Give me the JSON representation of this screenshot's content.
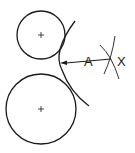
{
  "diagram": {
    "labels": {
      "radius": "A",
      "center_point": "X"
    },
    "circles": [
      {
        "name": "small-circle",
        "cx": 41,
        "cy": 35,
        "r": 24
      },
      {
        "name": "large-circle",
        "cx": 41,
        "cy": 109,
        "r": 35
      }
    ],
    "tangent_arc": {
      "cx": 111,
      "cy": 60,
      "r": 50
    },
    "colors": {
      "stroke": "#1a1a1a",
      "background": "#ffffff"
    }
  }
}
